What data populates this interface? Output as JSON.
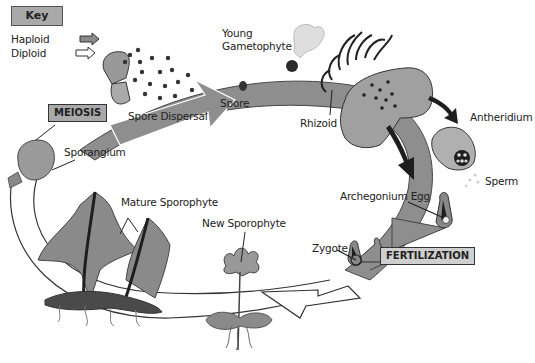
{
  "key": {
    "title": "Key",
    "items": [
      {
        "label": "Haploid",
        "arrow_fill": "#8a8a8a",
        "icon": "filled-arrow-icon"
      },
      {
        "label": "Diploid",
        "arrow_fill": "#ffffff",
        "icon": "outline-arrow-icon"
      }
    ]
  },
  "stages": {
    "meiosis": "MEIOSIS",
    "fertilization": "FERTILIZATION"
  },
  "labels": {
    "spore_dispersal": "Spore Dispersal",
    "spore": "Spore",
    "young_gametophyte_line1": "Young",
    "young_gametophyte_line2": "Gametophyte",
    "rhizoid": "Rhizoid",
    "antheridium": "Antheridium",
    "sperm": "Sperm",
    "archegonium_egg": "Archegonium Egg",
    "zygote": "Zygote",
    "new_sporophyte": "New Sporophyte",
    "mature_sporophyte": "Mature Sporophyte",
    "sporangium": "Sporangium"
  },
  "colors": {
    "haploid_band": "#8e8e8e",
    "diploid_band": "#ffffff",
    "plant_fill": "#8a8a8a",
    "dark": "#1e1e1e",
    "box_fill": "#a9a9a9"
  }
}
